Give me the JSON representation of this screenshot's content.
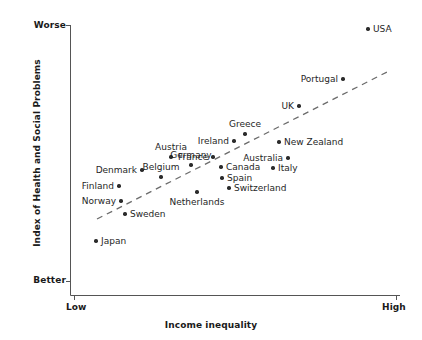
{
  "chart_data": {
    "type": "scatter",
    "title": "",
    "xlabel": "Income inequality",
    "ylabel": "Index of Health and Social Problems",
    "x_tick_labels": [
      "Low",
      "High"
    ],
    "y_tick_labels": [
      "Worse",
      "Better"
    ],
    "y_axis_top_label": "Worse",
    "y_axis_bottom_label": "Better",
    "grid": false,
    "legend": false,
    "trendline": {
      "present": true,
      "style": "dashed",
      "direction": "positive",
      "x_start_px": 97,
      "y_start_px": 219,
      "x_end_px": 389,
      "y_end_px": 71
    },
    "xlim_px": [
      70,
      400
    ],
    "ylim_px": [
      25,
      295
    ],
    "points": [
      {
        "name": "USA",
        "x_px": 368,
        "y_px": 29,
        "label_pos": "right"
      },
      {
        "name": "Portugal",
        "x_px": 343,
        "y_px": 79,
        "label_pos": "left"
      },
      {
        "name": "UK",
        "x_px": 299,
        "y_px": 106,
        "label_pos": "left"
      },
      {
        "name": "Greece",
        "x_px": 245,
        "y_px": 134,
        "label_pos": "above"
      },
      {
        "name": "Ireland",
        "x_px": 234,
        "y_px": 141,
        "label_pos": "left"
      },
      {
        "name": "New Zealand",
        "x_px": 279,
        "y_px": 142,
        "label_pos": "right"
      },
      {
        "name": "Austria",
        "x_px": 171,
        "y_px": 157,
        "label_pos": "above"
      },
      {
        "name": "France",
        "x_px": 213,
        "y_px": 157,
        "label_pos": "left"
      },
      {
        "name": "Australia",
        "x_px": 288,
        "y_px": 158,
        "label_pos": "left"
      },
      {
        "name": "Germany",
        "x_px": 191,
        "y_px": 165,
        "label_pos": "above"
      },
      {
        "name": "Canada",
        "x_px": 221,
        "y_px": 167,
        "label_pos": "right"
      },
      {
        "name": "Italy",
        "x_px": 273,
        "y_px": 168,
        "label_pos": "right"
      },
      {
        "name": "Denmark",
        "x_px": 142,
        "y_px": 170,
        "label_pos": "left"
      },
      {
        "name": "Belgium",
        "x_px": 161,
        "y_px": 177,
        "label_pos": "above"
      },
      {
        "name": "Spain",
        "x_px": 222,
        "y_px": 178,
        "label_pos": "right"
      },
      {
        "name": "Finland",
        "x_px": 119,
        "y_px": 186,
        "label_pos": "left"
      },
      {
        "name": "Switzerland",
        "x_px": 229,
        "y_px": 188,
        "label_pos": "right"
      },
      {
        "name": "Netherlands",
        "x_px": 197,
        "y_px": 192,
        "label_pos": "below"
      },
      {
        "name": "Norway",
        "x_px": 121,
        "y_px": 201,
        "label_pos": "left"
      },
      {
        "name": "Sweden",
        "x_px": 125,
        "y_px": 214,
        "label_pos": "right"
      },
      {
        "name": "Japan",
        "x_px": 96,
        "y_px": 241,
        "label_pos": "right"
      }
    ]
  },
  "colors": {
    "point": "#2b2b2b",
    "axis": "#4a4a4a",
    "trendline": "#6b6b6b",
    "text": "#1a1a1a",
    "background": "#ffffff"
  }
}
